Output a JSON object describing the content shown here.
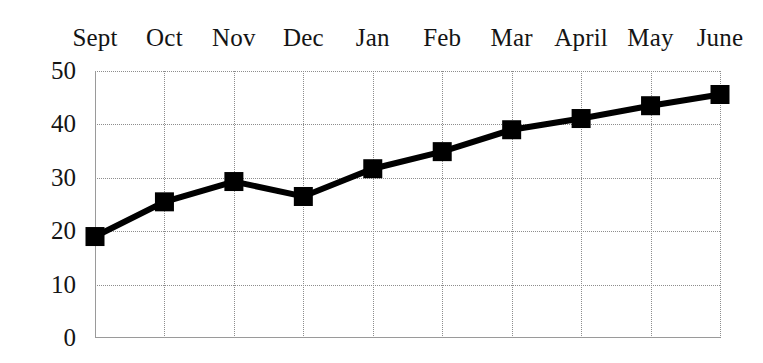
{
  "chart_data": {
    "type": "line",
    "title": "",
    "xlabel": "",
    "ylabel": "",
    "categories": [
      "Sept",
      "Oct",
      "Nov",
      "Dec",
      "Jan",
      "Feb",
      "Mar",
      "April",
      "May",
      "June"
    ],
    "values": [
      19,
      25.5,
      29.3,
      26.5,
      31.7,
      34.9,
      39,
      41.1,
      43.5,
      45.6
    ],
    "series": [
      {
        "name": "",
        "values": [
          19,
          25.5,
          29.3,
          26.5,
          31.7,
          34.9,
          39,
          41.1,
          43.5,
          45.6
        ]
      }
    ],
    "ylim": [
      0,
      50
    ],
    "yticks": [
      0,
      10,
      20,
      30,
      40,
      50
    ],
    "ytick_labels": [
      "0",
      "10",
      "20",
      "30",
      "40",
      "50"
    ],
    "grid": true,
    "grid_style": "dotted",
    "legend": "none",
    "xaxis_label_position": "top",
    "marker": "square",
    "line_color": "#000000",
    "marker_color": "#000000",
    "grid_color": "#8d8d8d",
    "axis_color": "#9a9a9a",
    "background": "#ffffff"
  }
}
